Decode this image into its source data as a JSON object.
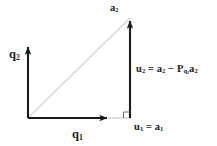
{
  "figure": {
    "type": "vector-diagram",
    "width": 217,
    "height": 146,
    "background": "#ffffff"
  },
  "colors": {
    "axis": "#1a1a1a",
    "diagonal": "#d9d9d9",
    "light_segment": "#cfcfcf",
    "text": "#1a1a1a"
  },
  "geometry": {
    "origin": {
      "x": 28,
      "y": 118
    },
    "q2_arrow_tip": {
      "x": 28,
      "y": 44
    },
    "q1_arrow_tip": {
      "x": 110,
      "y": 118
    },
    "a2_point": {
      "x": 130,
      "y": 18
    },
    "foot_point": {
      "x": 130,
      "y": 118
    },
    "right_angle_marker": {
      "x": 124,
      "y": 112,
      "size": 6
    }
  },
  "labels": {
    "q2": {
      "text": "q",
      "sub": "2",
      "x": 9,
      "y": 48
    },
    "q1": {
      "text": "q",
      "sub": "1",
      "x": 72,
      "y": 128
    },
    "a2": {
      "text": "a",
      "sub": "2",
      "x": 110,
      "y": 3
    },
    "u1_eq_a1": {
      "u": "u",
      "u_sub": "1",
      "eq": " = ",
      "a": "a",
      "a_sub": "1",
      "x": 134,
      "y": 122
    },
    "u2_equation": {
      "u": "u",
      "u_sub": "2",
      "eq": " = ",
      "a": "a",
      "a_sub": "2",
      "minus": " − ",
      "P": "P",
      "P_sub": "q",
      "P_sub_sub": "1",
      "a_last": "a",
      "a_last_sub": "2",
      "x": 136,
      "y": 64
    }
  }
}
